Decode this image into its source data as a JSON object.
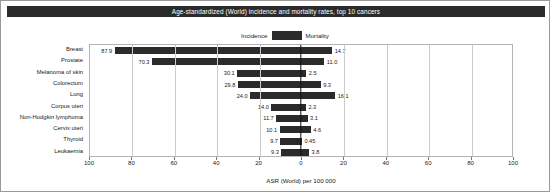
{
  "chart_data": {
    "type": "bar",
    "title": "Age-standardized (World) incidence and mortality rates, top 10 cancers",
    "xlabel": "ASR (World) per 100 000",
    "ylabel": "",
    "orientation": "horizontal",
    "layout": "diverging-bidirectional",
    "grid": true,
    "legend_position": "top-center",
    "xlim_left": [
      100,
      0
    ],
    "xlim_right": [
      0,
      100
    ],
    "axis_max": 100,
    "left_tick_labels": [
      "100",
      "80",
      "60",
      "40",
      "20",
      "0"
    ],
    "right_tick_labels": [
      "0",
      "20",
      "40",
      "60",
      "80",
      "100"
    ],
    "categories": [
      "Breast",
      "Prostate",
      "Melanoma of skin",
      "Colorectum",
      "Lung",
      "Corpus uteri",
      "Non-Hodgkin lymphoma",
      "Cervix uteri",
      "Thyroid",
      "Leukaemia"
    ],
    "series": [
      {
        "name": "Incidence",
        "side": "left",
        "color": "#2b2b2b",
        "values": [
          87.9,
          70.3,
          30.1,
          29.8,
          24.0,
          14.0,
          11.7,
          10.1,
          9.7,
          9.3
        ],
        "value_labels": [
          "87.9",
          "70.3",
          "30.1",
          "29.8",
          "24.0",
          "14.0",
          "11.7",
          "10.1",
          "9.7",
          "9.3"
        ]
      },
      {
        "name": "Mortality",
        "side": "right",
        "color": "#2b2b2b",
        "values": [
          14.7,
          11.0,
          2.5,
          9.3,
          16.1,
          2.3,
          3.1,
          4.6,
          0.45,
          3.8
        ],
        "value_labels": [
          "14.7",
          "11.0",
          "2.5",
          "9.3",
          "16.1",
          "2.3",
          "3.1",
          "4.6",
          "0.45",
          "3.8"
        ]
      }
    ]
  },
  "legend": {
    "incidence_label": "Incidence",
    "mortality_label": "Mortality",
    "swatch_color": "#2b2b2b"
  },
  "colors": {
    "title_bar_bg": "#2b2b2b",
    "title_bar_text": "#ffffff",
    "bar": "#2b2b2b",
    "grid": "#cccccc",
    "axis": "#111111",
    "frame": "#b4b4b4"
  }
}
